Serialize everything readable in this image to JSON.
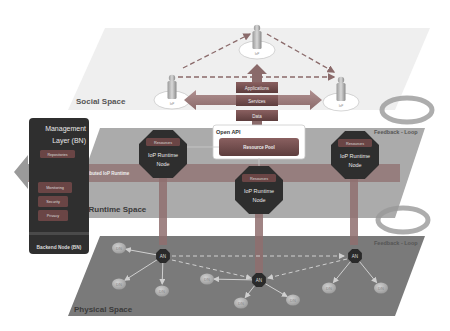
{
  "layers": {
    "social": "Social Space",
    "runtime": "IoP Runtime Space",
    "physical": "Physical Space"
  },
  "stack": [
    "Applications",
    "Services",
    "Data"
  ],
  "open_api": "Open API",
  "resource_pool": "Resource Pool",
  "distributed_runtime": "Distributed IoP Runtime",
  "runtime_nodes": [
    {
      "resources": "Resources",
      "title1": "IoP Runtime",
      "title2": "Node"
    },
    {
      "resources": "Resources",
      "title1": "IoP Runtime",
      "title2": "Node"
    },
    {
      "resources": "Resources",
      "title1": "IoP Runtime",
      "title2": "Node"
    }
  ],
  "management": {
    "title1": "Management",
    "title2": "Layer (BN)",
    "items": [
      "Repositories",
      "Monitoring",
      "Security",
      "Privacy"
    ],
    "footer": "Backend Node (BN)"
  },
  "feedback_loops": [
    "Feedback - Loop",
    "Feedback - Loop"
  ],
  "people_label": "IoP",
  "an_label": "AN",
  "dn_label": "DN",
  "colors": {
    "node_dark": "#2e2e2e",
    "bar_red": "#7a4a4a",
    "plane_runtime": "#a9a9a9",
    "plane_physical": "#7b7b7b",
    "plane_social": "#f1f1f1"
  }
}
